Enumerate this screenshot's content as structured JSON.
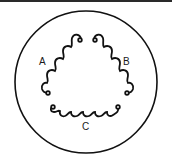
{
  "diagram": {
    "colors": {
      "stroke": "#111111",
      "background": "#ffffff"
    },
    "coils": [
      {
        "id": "A",
        "label": "A"
      },
      {
        "id": "B",
        "label": "B"
      },
      {
        "id": "C",
        "label": "C"
      }
    ]
  }
}
